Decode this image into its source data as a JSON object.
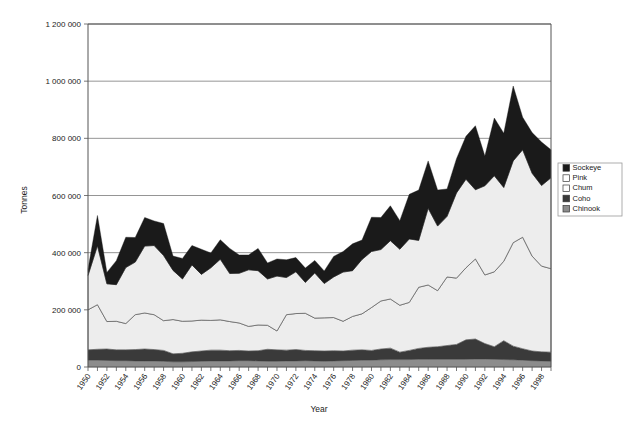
{
  "chart_data": {
    "type": "area",
    "stacked": true,
    "title": "",
    "xlabel": "Year",
    "ylabel": "Tonnes",
    "ylim": [
      0,
      1200000
    ],
    "ytick_values": [
      0,
      200000,
      400000,
      600000,
      800000,
      1000000,
      1200000
    ],
    "ytick_labels": [
      "0",
      "200 000",
      "400 000",
      "600 000",
      "800 000",
      "1 000 000",
      "1 200 000"
    ],
    "grid": true,
    "legend_position": "right",
    "xlim": [
      1950,
      1999
    ],
    "xtick_labels": [
      "1950",
      "1952",
      "1954",
      "1956",
      "1958",
      "1960",
      "1962",
      "1964",
      "1966",
      "1968",
      "1970",
      "1972",
      "1974",
      "1976",
      "1978",
      "1980",
      "1982",
      "1984",
      "1986",
      "1988",
      "1990",
      "1992",
      "1994",
      "1996",
      "1998"
    ],
    "x": [
      1950,
      1951,
      1952,
      1953,
      1954,
      1955,
      1956,
      1957,
      1958,
      1959,
      1960,
      1961,
      1962,
      1963,
      1964,
      1965,
      1966,
      1967,
      1968,
      1969,
      1970,
      1971,
      1972,
      1973,
      1974,
      1975,
      1976,
      1977,
      1978,
      1979,
      1980,
      1981,
      1982,
      1983,
      1984,
      1985,
      1986,
      1987,
      1988,
      1989,
      1990,
      1991,
      1992,
      1993,
      1994,
      1995,
      1996,
      1997,
      1998,
      1999
    ],
    "stack_order_bottom_to_top": [
      "Chinook",
      "Coho",
      "Chum",
      "Pink",
      "Sockeye"
    ],
    "series": [
      {
        "name": "Chinook",
        "color": "#8c8c8c",
        "legend_swatch": "filled-gray",
        "values": [
          24000,
          24000,
          23000,
          22000,
          22000,
          21000,
          21000,
          21000,
          20000,
          18000,
          18000,
          19000,
          20000,
          21000,
          21000,
          21000,
          22000,
          22000,
          21000,
          20000,
          20000,
          21000,
          21000,
          22000,
          21000,
          20000,
          21000,
          22000,
          23000,
          24000,
          24000,
          25000,
          26000,
          26000,
          26000,
          27000,
          27000,
          27000,
          27000,
          27000,
          27000,
          28000,
          28000,
          27000,
          26000,
          25000,
          24000,
          22000,
          21000,
          20000
        ]
      },
      {
        "name": "Coho",
        "color": "#3a3a3a",
        "legend_swatch": "filled-dark",
        "values": [
          36000,
          38000,
          40000,
          38000,
          38000,
          40000,
          42000,
          40000,
          38000,
          28000,
          30000,
          34000,
          36000,
          38000,
          38000,
          36000,
          36000,
          34000,
          36000,
          42000,
          40000,
          38000,
          40000,
          36000,
          36000,
          36000,
          36000,
          34000,
          36000,
          36000,
          34000,
          38000,
          40000,
          26000,
          32000,
          38000,
          42000,
          44000,
          48000,
          52000,
          68000,
          70000,
          54000,
          44000,
          66000,
          48000,
          40000,
          34000,
          32000,
          32000
        ]
      },
      {
        "name": "Chum",
        "color": "#ededed",
        "legend_swatch": "outline-white",
        "values": [
          140000,
          156000,
          96000,
          100000,
          92000,
          122000,
          126000,
          122000,
          104000,
          120000,
          112000,
          108000,
          108000,
          104000,
          106000,
          102000,
          96000,
          86000,
          90000,
          84000,
          66000,
          124000,
          126000,
          130000,
          114000,
          116000,
          116000,
          104000,
          118000,
          126000,
          150000,
          168000,
          172000,
          164000,
          168000,
          214000,
          218000,
          196000,
          240000,
          232000,
          252000,
          280000,
          240000,
          262000,
          278000,
          362000,
          390000,
          332000,
          300000,
          292000
        ]
      },
      {
        "name": "Pink",
        "color": "#ededed",
        "legend_swatch": "outline-white",
        "values": [
          120000,
          206000,
          132000,
          128000,
          196000,
          184000,
          234000,
          242000,
          228000,
          172000,
          148000,
          196000,
          160000,
          184000,
          212000,
          168000,
          174000,
          198000,
          190000,
          162000,
          192000,
          130000,
          146000,
          108000,
          158000,
          120000,
          142000,
          172000,
          160000,
          190000,
          196000,
          180000,
          204000,
          196000,
          222000,
          164000,
          268000,
          226000,
          212000,
          298000,
          310000,
          242000,
          312000,
          336000,
          258000,
          286000,
          306000,
          290000,
          282000,
          318000
        ]
      },
      {
        "name": "Sockeye",
        "color": "#1a1a1a",
        "legend_swatch": "filled-black",
        "values": [
          22000,
          106000,
          40000,
          84000,
          106000,
          86000,
          100000,
          86000,
          112000,
          50000,
          72000,
          68000,
          88000,
          52000,
          68000,
          88000,
          64000,
          52000,
          78000,
          56000,
          60000,
          62000,
          50000,
          50000,
          44000,
          44000,
          72000,
          72000,
          94000,
          68000,
          120000,
          112000,
          122000,
          100000,
          156000,
          176000,
          166000,
          126000,
          96000,
          120000,
          150000,
          224000,
          104000,
          202000,
          190000,
          262000,
          114000,
          142000,
          152000,
          98000
        ]
      }
    ],
    "totals_note": "Stacked totals range from about 340 000 tonnes in 1950 to a peak near 1 030 000 tonnes in 1995"
  },
  "legend": {
    "items": [
      {
        "label": "Sockeye",
        "swatch": "filled-black",
        "color": "#1a1a1a"
      },
      {
        "label": "Pink",
        "swatch": "outline-white",
        "color": "#ffffff"
      },
      {
        "label": "Chum",
        "swatch": "outline-white",
        "color": "#ffffff"
      },
      {
        "label": "Coho",
        "swatch": "filled-dark",
        "color": "#3a3a3a"
      },
      {
        "label": "Chinook",
        "swatch": "filled-gray",
        "color": "#8c8c8c"
      }
    ]
  }
}
